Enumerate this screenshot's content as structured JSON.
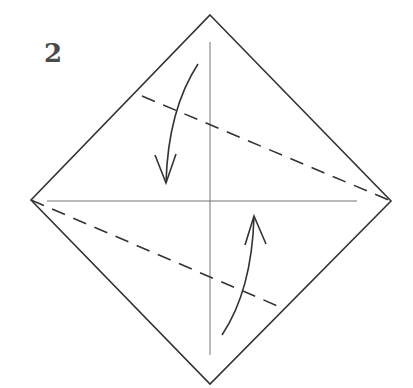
{
  "diagram": {
    "step_number": "2",
    "type": "origami-folding-instruction",
    "colors": {
      "outline": "#333333",
      "crease": "#777777",
      "dashed": "#333333",
      "arrow": "#333333"
    },
    "square": {
      "top": [
        210,
        15
      ],
      "right": [
        391,
        201
      ],
      "bottom": [
        210,
        384
      ],
      "left": [
        31,
        200
      ]
    },
    "creases": [
      {
        "name": "vertical-crease",
        "from": [
          210,
          42
        ],
        "to": [
          210,
          355
        ]
      },
      {
        "name": "horizontal-crease",
        "from": [
          47,
          201
        ],
        "to": [
          357,
          201
        ]
      }
    ],
    "valley_folds": [
      {
        "name": "upper-valley-fold",
        "from": [
          142,
          96
        ],
        "to": [
          391,
          201
        ]
      },
      {
        "name": "lower-valley-fold",
        "from": [
          31,
          200
        ],
        "to": [
          280,
          307
        ]
      }
    ],
    "arrows": [
      {
        "name": "fold-down-arrow",
        "direction": "down",
        "from": [
          198,
          64
        ],
        "to": [
          166,
          183
        ]
      },
      {
        "name": "fold-up-arrow",
        "direction": "up",
        "from": [
          222,
          335
        ],
        "to": [
          254,
          216
        ]
      }
    ]
  }
}
